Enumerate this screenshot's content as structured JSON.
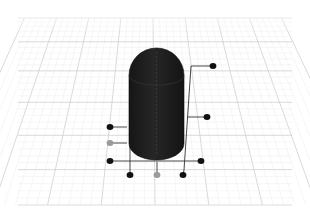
{
  "scene": {
    "title": "3D capsule on perspective grid with callout markers",
    "background": "#ffffff",
    "grid": {
      "minor_color": "#ececec",
      "major_color": "#cfcfcf",
      "floor": {
        "top_left": [
          22,
          18
        ],
        "top_right": [
          290,
          18
        ],
        "bottom_right": [
          290,
          205
        ],
        "bottom_left": [
          22,
          205
        ]
      }
    },
    "capsule": {
      "color": "#1d1d1d",
      "highlight": "#2e2e2e",
      "x": 129,
      "y": 48,
      "width": 55,
      "height": 112
    },
    "markers": [
      {
        "id": "marker-top-right",
        "x": 213,
        "y": 66,
        "color": "#111111"
      },
      {
        "id": "marker-mid-right",
        "x": 207,
        "y": 117,
        "color": "#111111"
      },
      {
        "id": "marker-left-upper",
        "x": 110,
        "y": 127,
        "color": "#111111"
      },
      {
        "id": "marker-left-middle",
        "x": 110,
        "y": 143,
        "color": "#9a9a9a"
      },
      {
        "id": "marker-left-lower",
        "x": 110,
        "y": 161,
        "color": "#111111"
      },
      {
        "id": "marker-right-lower",
        "x": 201,
        "y": 161,
        "color": "#111111"
      },
      {
        "id": "marker-bottom-left",
        "x": 130,
        "y": 175,
        "color": "#111111"
      },
      {
        "id": "marker-bottom-center",
        "x": 157,
        "y": 175,
        "color": "#9a9a9a"
      },
      {
        "id": "marker-bottom-right",
        "x": 183,
        "y": 175,
        "color": "#111111"
      }
    ],
    "leaders": [
      {
        "id": "leader-top-right",
        "points": [
          [
            213,
            66
          ],
          [
            191,
            66
          ],
          [
            184,
            170
          ],
          [
            183,
            175
          ]
        ]
      },
      {
        "id": "leader-mid-right",
        "points": [
          [
            207,
            117
          ],
          [
            187,
            117
          ]
        ]
      },
      {
        "id": "leader-left-upper",
        "points": [
          [
            110,
            127
          ],
          [
            127,
            127
          ]
        ]
      },
      {
        "id": "leader-left-middle",
        "points": [
          [
            110,
            143
          ],
          [
            127,
            143
          ]
        ]
      },
      {
        "id": "leader-bottom-horizontal",
        "points": [
          [
            110,
            161
          ],
          [
            201,
            161
          ]
        ]
      },
      {
        "id": "leader-bottom-left",
        "points": [
          [
            130,
            175
          ],
          [
            130,
            145
          ]
        ]
      },
      {
        "id": "leader-bottom-center",
        "points": [
          [
            157,
            175
          ],
          [
            157,
            162
          ]
        ]
      }
    ]
  }
}
